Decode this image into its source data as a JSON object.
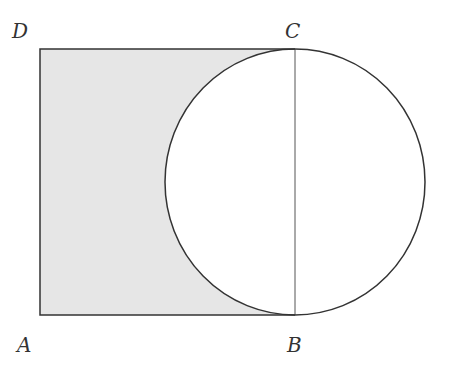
{
  "diagram": {
    "labels": {
      "A": "A",
      "B": "B",
      "C": "C",
      "D": "D"
    },
    "colors": {
      "shade": "#e6e6e6",
      "stroke": "#333333"
    }
  }
}
